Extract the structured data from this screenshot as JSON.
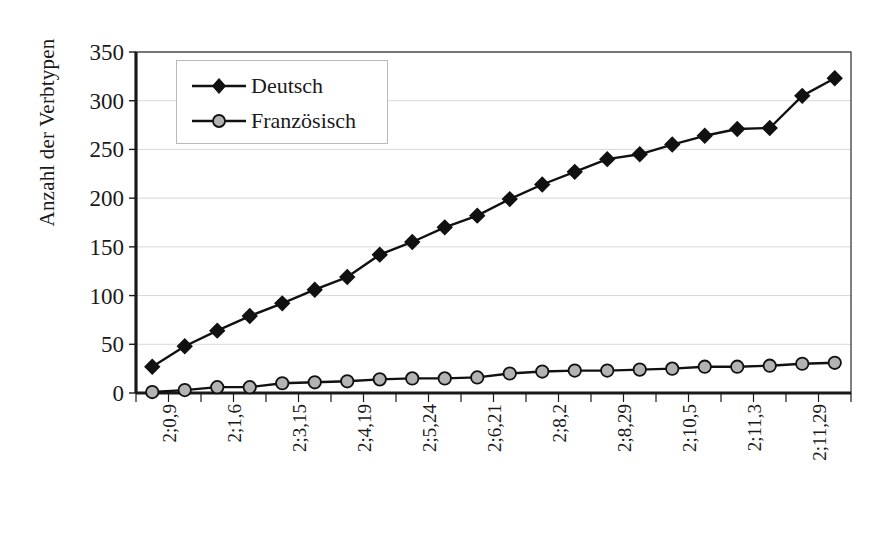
{
  "chart_data": {
    "type": "line",
    "title": "",
    "xlabel": "Alter",
    "ylabel": "Anzahl der Verbtypen",
    "ylim": [
      0,
      350
    ],
    "ytick_step": 50,
    "yticks": [
      0,
      50,
      100,
      150,
      200,
      250,
      300,
      350
    ],
    "ytick_labels": [
      "0",
      "50",
      "100",
      "150",
      "200",
      "250",
      "300",
      "350"
    ],
    "grid": "horizontal",
    "legend_position": "top-left-inside",
    "x_tick_labels": [
      "2;0,9",
      "2;1,6",
      "2;3,15",
      "2;4,19",
      "2;5,24",
      "2;6,21",
      "2;8,2",
      "2;8,29",
      "2;10,5",
      "2;11,3",
      "2;11,29"
    ],
    "x_tick_label_indices": [
      0,
      2,
      4,
      6,
      8,
      10,
      12,
      14,
      16,
      18,
      20
    ],
    "n_points": 22,
    "series": [
      {
        "name": "Deutsch",
        "color": "#111111",
        "marker": "diamond",
        "values": [
          27,
          48,
          64,
          79,
          92,
          106,
          119,
          142,
          155,
          170,
          182,
          199,
          214,
          227,
          240,
          245,
          255,
          264,
          271,
          272,
          305,
          323
        ]
      },
      {
        "name": "Französisch",
        "color": "#b3b3b3",
        "marker": "circle",
        "values": [
          1,
          3,
          6,
          6,
          10,
          11,
          12,
          14,
          15,
          15,
          16,
          20,
          22,
          23,
          23,
          24,
          25,
          27,
          27,
          28,
          30,
          31
        ]
      }
    ]
  },
  "legend": {
    "items": [
      {
        "label": "Deutsch",
        "marker": "diamond-marker-icon"
      },
      {
        "label": "Französisch",
        "marker": "circle-marker-icon"
      }
    ]
  },
  "axes": {
    "y_title": "Anzahl der Verbtypen",
    "x_title": "Alter"
  },
  "colors": {
    "deutsch": "#111111",
    "franzoesisch": "#b3b3b3",
    "gridline": "#d9d9d9",
    "axis": "#1a1a1a",
    "background": "#ffffff"
  }
}
